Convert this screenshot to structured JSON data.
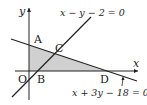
{
  "diagram": {
    "axes": {
      "x_label": "x",
      "y_label": "y",
      "origin_label": "O"
    },
    "points": {
      "A": "A",
      "B": "B",
      "C": "C",
      "D": "D"
    },
    "lines": [
      {
        "id": "line1",
        "equation": "x − y − 2 = 0"
      },
      {
        "id": "line2",
        "equation": "x + 3y − 18 = 0"
      }
    ],
    "shaded_region": {
      "vertices": [
        "O",
        "A",
        "C",
        "D"
      ],
      "color": "#cfcfcf"
    },
    "colors": {
      "stroke": "#222222",
      "shade": "#d0d0d0"
    }
  }
}
